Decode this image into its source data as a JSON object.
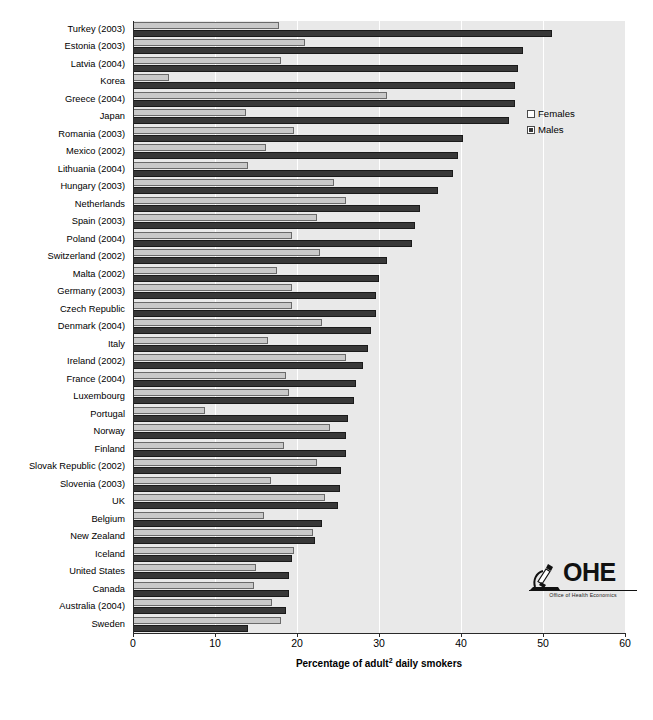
{
  "chart_data": {
    "type": "bar",
    "orientation": "horizontal",
    "title": "",
    "xlabel": "Percentage of  adult² daily smokers",
    "xlabel_parts": {
      "before": "Percentage of  adult",
      "sup": "2",
      "after": " daily smokers"
    },
    "ylabel": "",
    "xlim": [
      0,
      60
    ],
    "xticks": [
      0,
      10,
      20,
      30,
      40,
      50,
      60
    ],
    "grid": "vertical-white-gridlines",
    "legend_position": "inside-right-top",
    "categories": [
      "Turkey (2003)",
      "Estonia (2003)",
      "Latvia (2004)",
      "Korea",
      "Greece (2004)",
      "Japan",
      "Romania (2003)",
      "Mexico (2002)",
      "Lithuania (2004)",
      "Hungary (2003)",
      "Netherlands",
      "Spain (2003)",
      "Poland (2004)",
      "Switzerland (2002)",
      "Malta (2002)",
      "Germany (2003)",
      "Czech Republic",
      "Denmark (2004)",
      "Italy",
      "Ireland (2002)",
      "France (2004)",
      "Luxembourg",
      "Portugal",
      "Norway",
      "Finland",
      "Slovak Republic (2002)",
      "Slovenia (2003)",
      "UK",
      "Belgium",
      "New Zealand",
      "Iceland",
      "United States",
      "Canada",
      "Australia (2004)",
      "Sweden"
    ],
    "series": [
      {
        "name": "Females",
        "color": "#c9c9c9",
        "values": [
          17.8,
          21.0,
          18.0,
          4.4,
          31.0,
          13.8,
          19.6,
          16.2,
          14.0,
          24.5,
          26.0,
          22.4,
          19.4,
          22.8,
          17.6,
          19.4,
          19.4,
          23.0,
          16.5,
          26.0,
          18.6,
          19.0,
          8.8,
          24.0,
          18.4,
          22.4,
          16.8,
          23.4,
          16.0,
          22.0,
          19.6,
          15.0,
          14.8,
          17.0,
          18.0
        ]
      },
      {
        "name": "Males",
        "color": "#383838",
        "values": [
          51.1,
          47.5,
          47.0,
          46.6,
          46.6,
          45.8,
          40.2,
          39.6,
          39.0,
          37.2,
          35.0,
          34.4,
          34.0,
          31.0,
          30.0,
          29.6,
          29.6,
          29.0,
          28.6,
          28.0,
          27.2,
          27.0,
          26.2,
          26.0,
          26.0,
          25.4,
          25.2,
          25.0,
          23.0,
          22.2,
          19.4,
          19.0,
          19.0,
          18.6,
          14.0
        ]
      }
    ]
  },
  "legend": {
    "items": [
      {
        "label": "Females",
        "swatch": "light-gray"
      },
      {
        "label": "Males",
        "swatch": "dark-gray"
      }
    ]
  },
  "logo": {
    "name": "OHE",
    "initials": "OHE",
    "tagline": "Office of Health Economics"
  }
}
